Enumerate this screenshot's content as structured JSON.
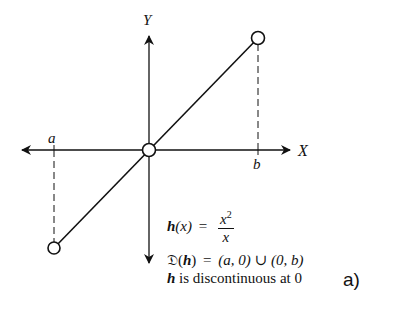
{
  "figure": {
    "axes": {
      "x_label": "X",
      "y_label": "Y",
      "x_tick_labels": {
        "left": "a",
        "right": "b"
      }
    },
    "graph": {
      "type": "line-segment",
      "description": "line y = x on open intervals with hole at origin",
      "points_open": [
        {
          "name": "left-endpoint",
          "x": "a",
          "y": "a"
        },
        {
          "name": "origin-hole",
          "x": "0",
          "y": "0"
        },
        {
          "name": "right-endpoint",
          "x": "b",
          "y": "b"
        }
      ],
      "line_color": "#111111"
    },
    "annotations": {
      "function_lhs_name": "h",
      "function_lhs_arg": "(x)",
      "equals": "=",
      "numerator_base": "x",
      "numerator_exp": "2",
      "denominator": "x",
      "domain_symbol": "𝔇",
      "domain_paren_open": "(",
      "domain_func": "h",
      "domain_paren_close": ")",
      "domain_equals": "=",
      "domain_value_1": "(a, 0)",
      "union": "∪",
      "domain_value_2": "(0, b)",
      "statement_func": "h",
      "statement_text": "is discontinuous at 0"
    },
    "part_label": "a)"
  }
}
